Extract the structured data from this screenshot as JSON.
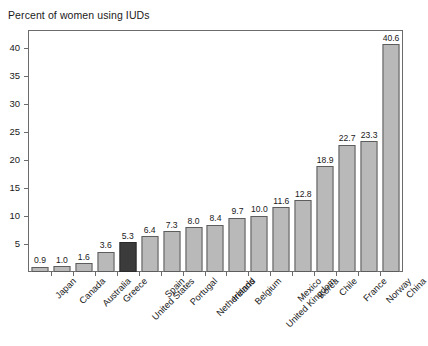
{
  "chart_data": {
    "type": "bar",
    "title": "Percent of women using IUDs",
    "xlabel": "",
    "ylabel": "",
    "ylim": [
      0,
      43
    ],
    "yticks": [
      5,
      10,
      15,
      20,
      25,
      30,
      35,
      40
    ],
    "grid": false,
    "legend": null,
    "highlight_category": "United States",
    "colors": {
      "bar_fill": "#b9b9b9",
      "bar_stroke": "#5d5d5d",
      "highlight_fill": "#3b3b3b",
      "highlight_stroke": "#2a2a2a",
      "frame": "#6b6b6b",
      "text": "#1a1a1a",
      "background": "#ffffff"
    },
    "categories": [
      "Japan",
      "Canada",
      "Australia",
      "Greece",
      "United States",
      "Spain",
      "Portugal",
      "Netherlands",
      "Ireland",
      "Belgium",
      "United Kingdom",
      "Mexico",
      "Korea",
      "Chile",
      "France",
      "Norway",
      "China"
    ],
    "values": [
      0.9,
      1.0,
      1.6,
      3.6,
      5.3,
      6.4,
      7.3,
      8.0,
      8.4,
      9.7,
      10.0,
      11.6,
      12.8,
      18.9,
      22.7,
      23.3,
      40.6
    ],
    "value_labels": [
      "0.9",
      "1.0",
      "1.6",
      "3.6",
      "5.3",
      "6.4",
      "7.3",
      "8.0",
      "8.4",
      "9.7",
      "10.0",
      "11.6",
      "12.8",
      "18.9",
      "22.7",
      "23.3",
      "40.6"
    ]
  }
}
